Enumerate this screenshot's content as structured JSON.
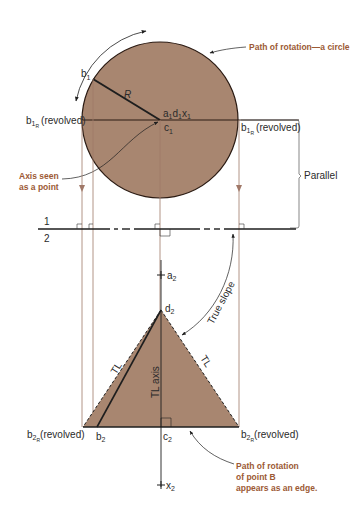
{
  "colors": {
    "fill": "#a88670",
    "line": "#1e1e1e",
    "projector": "#a07868",
    "note": "#9c5a35"
  },
  "top_view": {
    "circle_note": "Path of rotation—a circle",
    "b1": "b",
    "b1_sub": "1",
    "R": "R",
    "center_label": "a",
    "center_label_full": "a1d1x1",
    "c1": "c",
    "c1_sub": "1",
    "b1R_left": "(revolved)",
    "b1R_right": "(revolved)",
    "b1R_letter": "b",
    "b1R_sub": "1",
    "b1R_subsub": "R",
    "axis_note_line1": "Axis seen",
    "axis_note_line2": "as a point",
    "parallel": "Parallel"
  },
  "fold_line": {
    "label_top": "1",
    "label_bottom": "2"
  },
  "front_view": {
    "a2": "a",
    "a2_sub": "2",
    "d2": "d",
    "d2_sub": "2",
    "true_slope": "True slope",
    "tl_left": "TL",
    "tl_right": "TL",
    "tl_axis": "TL axis",
    "b2R_letter": "b",
    "b2R_sub": "2",
    "b2R_subsub": "R",
    "b2R_left": "(revolved)",
    "b2R_right": "(revolved)",
    "b2": "b",
    "b2_sub": "2",
    "c2": "c",
    "c2_sub": "2",
    "x2": "x",
    "x2_sub": "2",
    "edge_note_line1": "Path of rotation",
    "edge_note_line2": "of point B",
    "edge_note_line3": "appears as an edge."
  }
}
